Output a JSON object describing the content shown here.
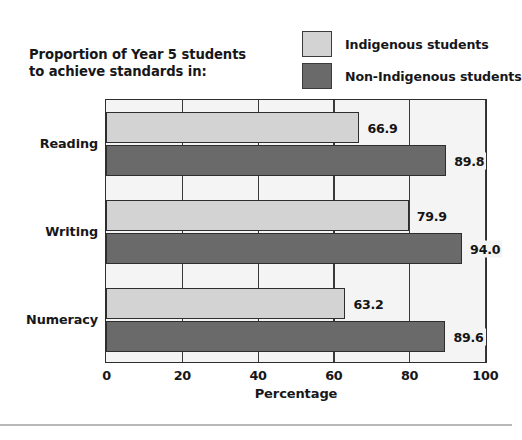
{
  "chart_data": {
    "type": "bar",
    "orientation": "horizontal",
    "title": "Proportion of Year 5 students\nto achieve standards in:",
    "xlabel": "Percentage",
    "ylabel": "",
    "xlim": [
      0,
      100
    ],
    "xticks": [
      "0",
      "20",
      "40",
      "60",
      "80",
      "100"
    ],
    "grid": true,
    "legend_position": "top-right",
    "categories": [
      "Reading",
      "Writing",
      "Numeracy"
    ],
    "series": [
      {
        "name": "Indigenous students",
        "color": "#d3d3d3",
        "values": [
          66.9,
          79.9,
          63.2
        ],
        "labels": [
          "66.9",
          "79.9",
          "63.2"
        ]
      },
      {
        "name": "Non-Indigenous students",
        "color": "#6a6a6a",
        "values": [
          89.8,
          94.0,
          89.6
        ],
        "labels": [
          "89.8",
          "94.0",
          "89.6"
        ]
      }
    ]
  },
  "legend": {
    "items": [
      {
        "label": "Indigenous students",
        "swatch": "#d3d3d3"
      },
      {
        "label": "Non-Indigenous students",
        "swatch": "#6a6a6a"
      }
    ]
  },
  "axis": {
    "x_title": "Percentage",
    "ticks": [
      "0",
      "20",
      "40",
      "60",
      "80",
      "100"
    ],
    "categories": [
      "Reading",
      "Writing",
      "Numeracy"
    ]
  },
  "values": {
    "reading_indigenous": "66.9",
    "reading_non_indigenous": "89.8",
    "writing_indigenous": "79.9",
    "writing_non_indigenous": "94.0",
    "numeracy_indigenous": "63.2",
    "numeracy_non_indigenous": "89.6"
  },
  "colors": {
    "indigenous": "#d3d3d3",
    "non_indigenous": "#6a6a6a",
    "panel_background": "#f4f4f4",
    "gridline": "#3a3a3a",
    "border": "#2e2e2e"
  }
}
